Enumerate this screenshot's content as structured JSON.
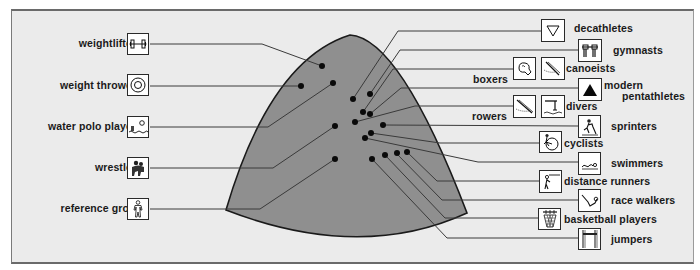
{
  "diagram": {
    "type": "body-type triangle (somatochart-style) with athlete groups plotted as points",
    "colors": {
      "background": "#ffffff",
      "panel": "#ebebeb",
      "shape_fill": "#8f8f8f",
      "shape_stroke": "#1a1a1a",
      "lines": "#3a3a3a",
      "dots": "#0a0a0a",
      "icon_bg": "#ffffff"
    },
    "left_groups": [
      {
        "label": "weightlifters",
        "icon": "dumbbell-icon"
      },
      {
        "label": "weight throwers",
        "icon": "target-circle-icon"
      },
      {
        "label": "water polo players",
        "icon": "water-polo-icon"
      },
      {
        "label": "wrestlers",
        "icon": "wrestlers-icon"
      },
      {
        "label": "reference group",
        "icon": "standing-person-icon"
      }
    ],
    "right_groups": [
      {
        "label": "decathletes",
        "icon": "triangle-outline-icon"
      },
      {
        "label": "gymnasts",
        "icon": "parallel-bars-icon"
      },
      {
        "label": "boxers",
        "icon": "boxing-glove-icon"
      },
      {
        "label": "canoeists",
        "icon": "canoe-paddle-icon"
      },
      {
        "label_line1": "modern",
        "label_line2": "pentathletes",
        "icon": "filled-triangle-icon"
      },
      {
        "label": "rowers",
        "icon": "rowing-oar-icon"
      },
      {
        "label": "divers",
        "icon": "diving-board-icon"
      },
      {
        "label": "sprinters",
        "icon": "sprinter-icon"
      },
      {
        "label": "cyclists",
        "icon": "bicycle-icon"
      },
      {
        "label": "swimmers",
        "icon": "swimmer-waves-icon"
      },
      {
        "label": "distance runners",
        "icon": "runner-icon"
      },
      {
        "label": "race walkers",
        "icon": "race-walker-icon"
      },
      {
        "label": "basketball players",
        "icon": "basketball-hoop-icon"
      },
      {
        "label": "jumpers",
        "icon": "high-jump-bar-icon"
      }
    ]
  }
}
